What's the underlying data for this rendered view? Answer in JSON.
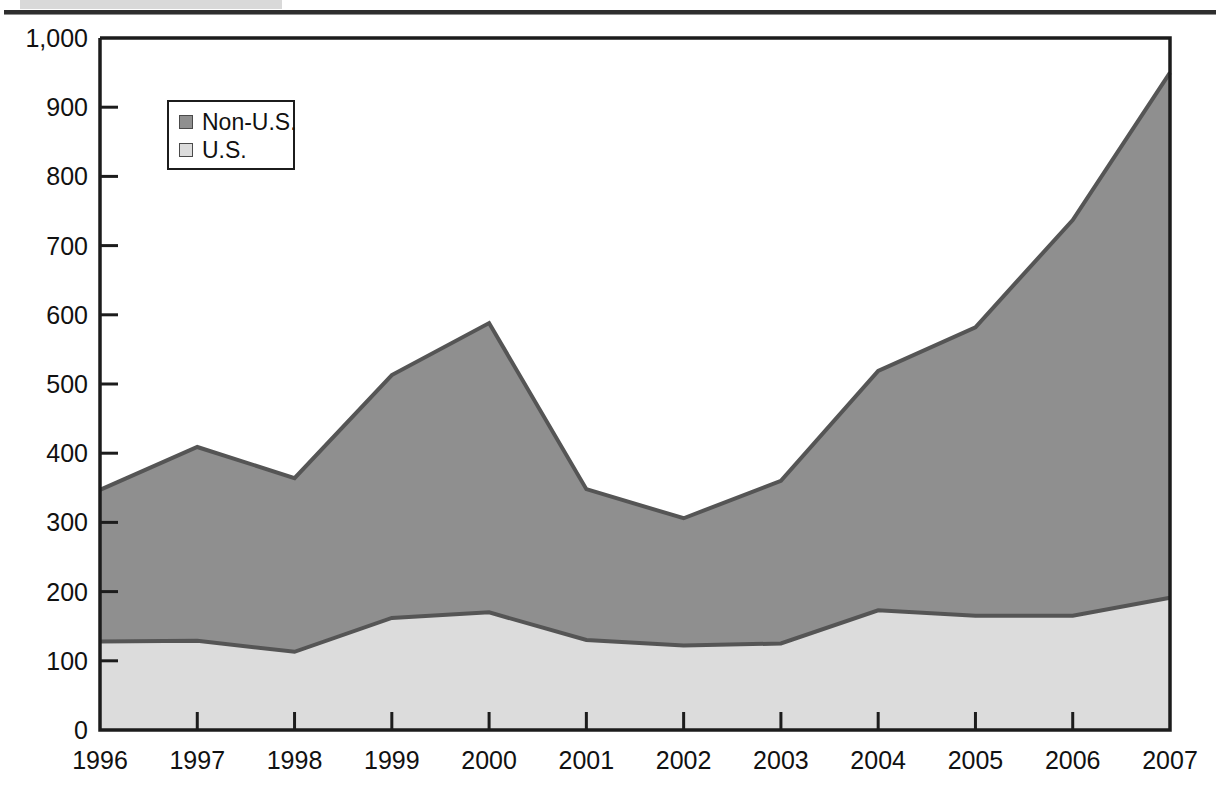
{
  "page": {
    "top_tab_color": "#d9d9d9",
    "rule_color": "#2e2e2e"
  },
  "legend": {
    "position": "inside-top-left",
    "entries": [
      {
        "label": "Non-U.S.",
        "swatch_name": "legend-swatch-non-us",
        "color": "#8f8f8f"
      },
      {
        "label": "U.S.",
        "swatch_name": "legend-swatch-us",
        "color": "#dcdcdc"
      }
    ]
  },
  "chart_data": {
    "type": "area",
    "stacked": true,
    "title": "",
    "subtitle": "",
    "xlabel": "",
    "ylabel": "",
    "grid": false,
    "legend_position": "top-left-inside",
    "categories": [
      "1996",
      "1997",
      "1998",
      "1999",
      "2000",
      "2001",
      "2002",
      "2003",
      "2004",
      "2005",
      "2006",
      "2007"
    ],
    "x": [
      1996,
      1997,
      1998,
      1999,
      2000,
      2001,
      2002,
      2003,
      2004,
      2005,
      2006,
      2007
    ],
    "xlim": [
      1996,
      2007
    ],
    "ylim": [
      0,
      1000
    ],
    "ytick_labels": [
      "0",
      "100",
      "200",
      "300",
      "400",
      "500",
      "600",
      "700",
      "800",
      "900",
      "1,000"
    ],
    "yticks": [
      0,
      100,
      200,
      300,
      400,
      500,
      600,
      700,
      800,
      900,
      1000
    ],
    "xtick_labels": [
      "1996",
      "1997",
      "1998",
      "1999",
      "2000",
      "2001",
      "2002",
      "2003",
      "2004",
      "2005",
      "2006",
      "2007"
    ],
    "series": [
      {
        "name": "U.S.",
        "color": "#dcdcdc",
        "stack_order": 1,
        "values": [
          128,
          129,
          113,
          162,
          170,
          130,
          122,
          125,
          173,
          165,
          165,
          191
        ]
      },
      {
        "name": "Non-U.S.",
        "color": "#8f8f8f",
        "stack_order": 2,
        "values": [
          219,
          280,
          251,
          351,
          418,
          218,
          184,
          235,
          346,
          417,
          572,
          759
        ]
      }
    ],
    "totals": [
      347,
      409,
      364,
      513,
      588,
      348,
      306,
      360,
      519,
      582,
      737,
      950
    ]
  }
}
